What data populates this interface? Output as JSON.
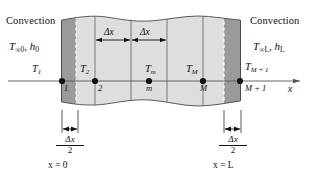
{
  "figure": {
    "type": "finite-difference-nodal-network-plane-wall",
    "left_boundary": {
      "convection_label": "Convection",
      "ambient_temp": "T",
      "ambient_temp_sub": "∞0",
      "coeff": "h",
      "coeff_sub": "0",
      "comma": ", "
    },
    "right_boundary": {
      "convection_label": "Convection",
      "ambient_temp": "T",
      "ambient_temp_sub": "∞L",
      "coeff": "h",
      "coeff_sub": "L",
      "comma": ", "
    },
    "nodes": [
      {
        "temp": "T",
        "temp_sub": "1",
        "index": "1"
      },
      {
        "temp": "T",
        "temp_sub": "2",
        "index": "2"
      },
      {
        "temp": "T",
        "temp_sub": "m",
        "index": "m"
      },
      {
        "temp": "T",
        "temp_sub": "M",
        "index": "M"
      },
      {
        "temp": "T",
        "temp_sub": "M + 1",
        "index": "M + 1"
      }
    ],
    "spacing_labels": [
      {
        "symbol": "Δx"
      },
      {
        "symbol": "Δx"
      }
    ],
    "half_spacing": {
      "numerator": "Δx",
      "denominator": "2"
    },
    "positions": {
      "left": "x = 0",
      "right": "x = L"
    },
    "axis_label": "x",
    "colors": {
      "wall_light": "#dedede",
      "wall_dark": "#9a9a9a",
      "line": "#5a5a5a",
      "ink": "#111111",
      "dashed": "#ffffff"
    }
  }
}
